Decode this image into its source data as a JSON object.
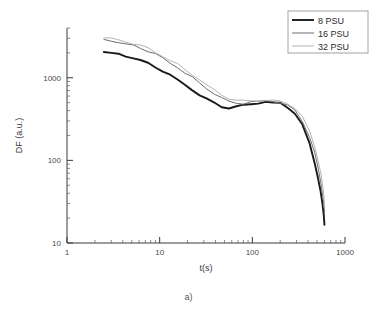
{
  "caption": "a)",
  "chart_data": {
    "type": "line",
    "title": "",
    "xlabel": "t(s)",
    "ylabel": "DF (a.u.)",
    "xscale": "log",
    "yscale": "log",
    "xlim": [
      1,
      1000
    ],
    "ylim": [
      10,
      4000
    ],
    "xticks": [
      1,
      10,
      100,
      1000
    ],
    "xticklabels": [
      "1",
      "10",
      "100",
      "1000"
    ],
    "yticks": [
      10,
      100,
      1000
    ],
    "yticklabels": [
      "10",
      "100",
      "1000"
    ],
    "grid": false,
    "legend_position": "top-right",
    "series": [
      {
        "name": "8 PSU",
        "color": "#1a1a1a",
        "width": 1.9,
        "x": [
          2.5,
          3.0,
          3.6,
          4.3,
          5.2,
          6.2,
          7.5,
          9.0,
          10.8,
          13.0,
          15.6,
          18.7,
          22.5,
          27.0,
          32.4,
          38.9,
          46.7,
          56.0,
          67.2,
          80.6,
          96.8,
          116.0,
          139.0,
          167.0,
          200.0,
          240.0,
          288.0,
          346.0,
          415.0,
          470.0,
          510.0,
          545.0,
          570.0,
          590.0,
          600.0
        ],
        "y": [
          2050,
          1980,
          1900,
          1820,
          1720,
          1610,
          1490,
          1360,
          1220,
          1080,
          950,
          830,
          720,
          625,
          545,
          485,
          448,
          432,
          440,
          460,
          482,
          498,
          505,
          500,
          482,
          442,
          372,
          272,
          158,
          95,
          62,
          42,
          30,
          22,
          17
        ]
      },
      {
        "name": "16 PSU",
        "color": "#6e6e6e",
        "width": 1.0,
        "x": [
          2.5,
          3.0,
          3.6,
          4.3,
          5.2,
          6.2,
          7.5,
          9.0,
          10.8,
          13.0,
          15.6,
          18.7,
          22.5,
          27.0,
          32.4,
          38.9,
          46.7,
          56.0,
          67.2,
          80.6,
          96.8,
          116.0,
          139.0,
          167.0,
          200.0,
          240.0,
          288.0,
          346.0,
          415.0,
          470.0,
          510.0,
          545.0,
          570.0,
          590.0,
          600.0
        ],
        "y": [
          2900,
          2800,
          2690,
          2570,
          2430,
          2280,
          2100,
          1920,
          1720,
          1520,
          1330,
          1160,
          1000,
          860,
          740,
          645,
          570,
          520,
          492,
          490,
          500,
          512,
          520,
          515,
          496,
          460,
          398,
          305,
          190,
          122,
          82,
          57,
          41,
          30,
          23
        ]
      },
      {
        "name": "32 PSU",
        "color": "#b4b4b4",
        "width": 1.0,
        "x": [
          2.5,
          3.0,
          3.6,
          4.3,
          5.2,
          6.2,
          7.5,
          9.0,
          10.8,
          13.0,
          15.6,
          18.7,
          22.5,
          27.0,
          32.4,
          38.9,
          46.7,
          56.0,
          67.2,
          80.6,
          96.8,
          116.0,
          139.0,
          167.0,
          200.0,
          240.0,
          288.0,
          346.0,
          415.0,
          470.0,
          510.0,
          545.0,
          570.0,
          590.0,
          600.0
        ],
        "y": [
          3050,
          2950,
          2840,
          2720,
          2580,
          2420,
          2240,
          2050,
          1850,
          1640,
          1440,
          1260,
          1090,
          940,
          810,
          705,
          625,
          565,
          530,
          520,
          525,
          535,
          540,
          535,
          518,
          485,
          428,
          340,
          222,
          148,
          102,
          72,
          52,
          38,
          28
        ]
      }
    ]
  }
}
